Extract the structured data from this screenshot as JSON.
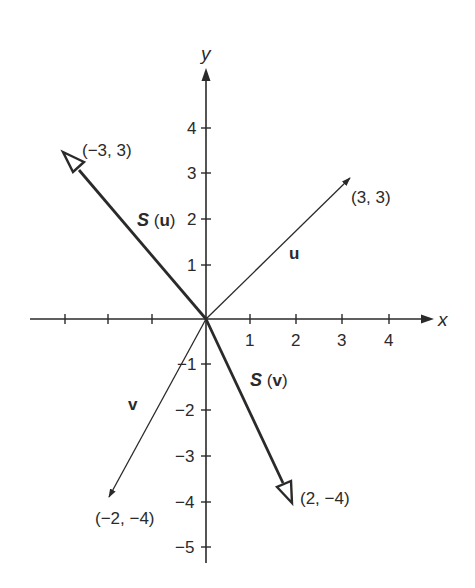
{
  "diagram": {
    "type": "coordinate-plane-vectors",
    "axes": {
      "x_label": "x",
      "y_label": "y",
      "x_ticks": [
        {
          "value": -4,
          "label": ""
        },
        {
          "value": -3,
          "label": ""
        },
        {
          "value": -2,
          "label": ""
        },
        {
          "value": 1,
          "label": "1"
        },
        {
          "value": 2,
          "label": "2"
        },
        {
          "value": 3,
          "label": "3"
        },
        {
          "value": 4,
          "label": "4"
        }
      ],
      "y_ticks": [
        {
          "value": 4,
          "label": "4"
        },
        {
          "value": 3,
          "label": "3"
        },
        {
          "value": 2,
          "label": "2"
        },
        {
          "value": 1,
          "label": "1"
        },
        {
          "value": -1,
          "label": "−1"
        },
        {
          "value": -2,
          "label": "−2"
        },
        {
          "value": -3,
          "label": "−3"
        },
        {
          "value": -4,
          "label": "−4"
        },
        {
          "value": -5,
          "label": "−5"
        }
      ]
    },
    "vectors": [
      {
        "name": "u",
        "label": "u",
        "endpoint_label": "(3, 3)",
        "endpoint": [
          3,
          3
        ],
        "style": "thin",
        "head": "filled"
      },
      {
        "name": "v",
        "label": "v",
        "endpoint_label": "(−2, −4)",
        "endpoint": [
          -2,
          -4
        ],
        "style": "thin",
        "head": "filled"
      },
      {
        "name": "S(u)",
        "label_S": "S",
        "label_open": " (",
        "label_arg": "u",
        "label_close": ")",
        "endpoint_label": "(−3, 3)",
        "endpoint": [
          -3,
          3
        ],
        "style": "thick",
        "head": "open"
      },
      {
        "name": "S(v)",
        "label_S": "S",
        "label_open": " (",
        "label_arg": "v",
        "label_close": ")",
        "endpoint_label": "(2, −4)",
        "endpoint": [
          2,
          -4
        ],
        "style": "thick",
        "head": "open"
      }
    ],
    "colors": {
      "ink": "#2a2a2a",
      "background": "#ffffff"
    }
  }
}
